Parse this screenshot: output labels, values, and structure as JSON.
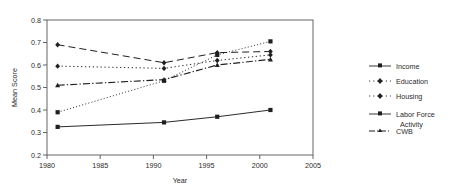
{
  "chart_data": {
    "type": "line",
    "title": "",
    "xlabel": "Year",
    "ylabel": "Mean Score",
    "xlim": [
      1980,
      2005
    ],
    "ylim": [
      0.2,
      0.8
    ],
    "grid": false,
    "legend_position": "right",
    "x": [
      1981,
      1991,
      1996,
      2001
    ],
    "xticks": [
      "1980",
      "1985",
      "1990",
      "1995",
      "2000",
      "2005"
    ],
    "xtick_values": [
      1980,
      1985,
      1990,
      1995,
      2000,
      2005
    ],
    "yticks": [
      "0.2",
      "0.3",
      "0.4",
      "0.5",
      "0.6",
      "0.7",
      "0.8"
    ],
    "ytick_values": [
      0.2,
      0.3,
      0.4,
      0.5,
      0.6,
      0.7,
      0.8
    ],
    "series": [
      {
        "name": "Income",
        "values": [
          0.325,
          0.345,
          0.37,
          0.4
        ],
        "style": "solid",
        "marker": "square"
      },
      {
        "name": "Education",
        "values": [
          0.595,
          0.585,
          0.62,
          0.645
        ],
        "style": "dotted",
        "marker": "diamond"
      },
      {
        "name": "Housing",
        "values": [
          0.69,
          0.61,
          0.655,
          0.66
        ],
        "style": "dashed",
        "marker": "diamond"
      },
      {
        "name": "Labor Force Activity",
        "values": [
          0.39,
          0.53,
          0.645,
          0.705
        ],
        "style": "fine-dotted",
        "marker": "square"
      },
      {
        "name": "CWB",
        "values": [
          0.51,
          0.535,
          0.6,
          0.625
        ],
        "style": "dash-dot",
        "marker": "triangle"
      }
    ]
  },
  "legend": {
    "items": [
      {
        "label": "Income"
      },
      {
        "label": "Education"
      },
      {
        "label": "Housing"
      },
      {
        "label": "Labor Force"
      },
      {
        "label": "Activity"
      },
      {
        "label": "CWB"
      }
    ]
  },
  "colors": {
    "ink": "#1f1f1f",
    "frame": "#555555",
    "background": "#ffffff"
  }
}
